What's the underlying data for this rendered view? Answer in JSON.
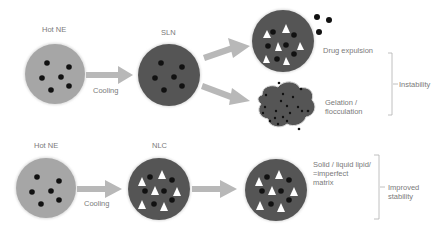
{
  "diagram": {
    "top_row": {
      "start_label": "Hot NE",
      "step_label": "Cooling",
      "particle_label": "SLN",
      "outcome_1": "Drug expulsion",
      "outcome_2_line1": "Gelation /",
      "outcome_2_line2": "flocculation",
      "group_label": "Instability"
    },
    "bottom_row": {
      "start_label": "Hot NE",
      "step_label": "Cooling",
      "particle_label": "NLC",
      "desc_line1": "Solid / liquid lipid/",
      "desc_line2": "=imperfect",
      "desc_line3": "matrix",
      "group_line1": "Improved",
      "group_line2": "stability"
    },
    "colors": {
      "hot_ne_fill": "#a6a6a6",
      "particle_fill": "#555555",
      "arrow": "#b8b8b8",
      "drug_dot": "#111111",
      "lipid_crystal": "#ffffff",
      "text": "#7a7a7a"
    }
  }
}
